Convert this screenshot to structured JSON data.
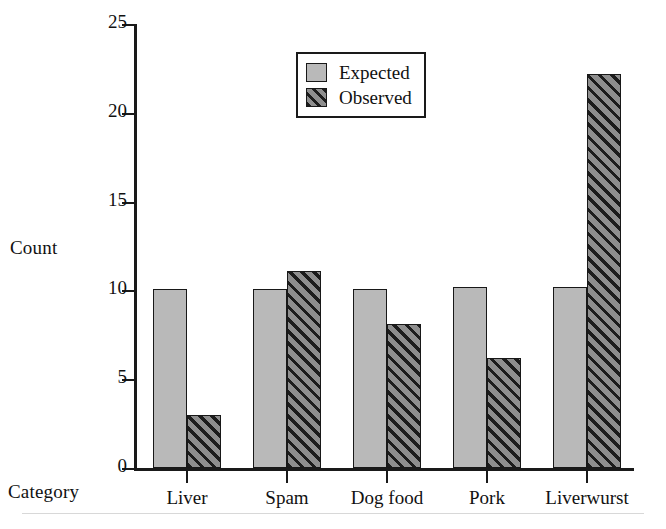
{
  "chart_data": {
    "type": "bar",
    "title": "",
    "xlabel": "Category",
    "ylabel": "Count",
    "categories": [
      "Liver",
      "Spam",
      "Dog food",
      "Pork",
      "Liverwurst"
    ],
    "series": [
      {
        "name": "Expected",
        "values": [
          10.1,
          10.1,
          10.1,
          10.2,
          10.2
        ],
        "color": "#b9b9b9",
        "fill": "solid"
      },
      {
        "name": "Observed",
        "values": [
          3.0,
          11.1,
          8.1,
          6.2,
          22.2
        ],
        "color": "#5b5b5b",
        "fill": "diagonal-hatch"
      }
    ],
    "ylim": [
      0,
      25
    ],
    "yticks": [
      0,
      5,
      10,
      15,
      20,
      25
    ],
    "ytick_labels": [
      "0",
      "5",
      "10",
      "15",
      "20",
      "25"
    ],
    "grid": false,
    "legend_position": "top-left-inside",
    "legend_entries": [
      "Expected",
      "Observed"
    ]
  },
  "axis": {
    "ylabel": "Count",
    "xlabel": "Category"
  },
  "legend": {
    "entries": [
      {
        "label": "Expected",
        "swatch": "solid-gray-swatch"
      },
      {
        "label": "Observed",
        "swatch": "hatched-swatch"
      }
    ]
  }
}
